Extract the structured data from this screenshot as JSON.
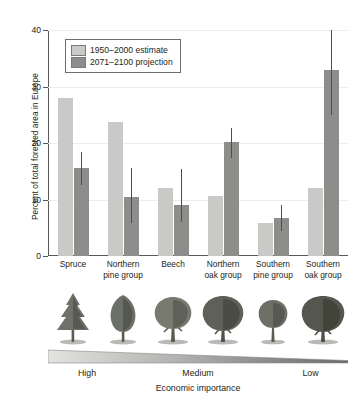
{
  "chart_data": {
    "type": "bar",
    "title": "",
    "xlabel": "Economic importance",
    "ylabel": "Percent of total forested area in Europe",
    "ylim": [
      0,
      40
    ],
    "yticks": [
      0,
      10,
      20,
      30,
      40
    ],
    "ytick_labels": [
      "0",
      "10",
      "20",
      "30",
      "40"
    ],
    "grid": true,
    "legend_position": "upper-left",
    "categories": [
      "Spruce",
      "Northern pine group",
      "Beech",
      "Northern oak group",
      "Southern pine group",
      "Southern oak group"
    ],
    "category_lines": [
      [
        "Spruce"
      ],
      [
        "Northern",
        "pine group"
      ],
      [
        "Beech"
      ],
      [
        "Northern",
        "oak group"
      ],
      [
        "Southern",
        "pine group"
      ],
      [
        "Southern",
        "oak group"
      ]
    ],
    "series": [
      {
        "name": "1950–2000 estimate",
        "color": "#c9c9c7",
        "values": [
          28.0,
          23.8,
          12.1,
          10.6,
          5.8,
          12.0
        ],
        "errors": [
          null,
          null,
          null,
          null,
          null,
          null
        ]
      },
      {
        "name": "2071–2100 projection",
        "color": "#8d8d8b",
        "values": [
          15.5,
          10.4,
          9.0,
          20.1,
          6.7,
          33.0
        ],
        "error_low": [
          12.5,
          5.8,
          6.0,
          17.4,
          4.5,
          25.0
        ],
        "error_high": [
          18.4,
          15.6,
          15.4,
          22.7,
          9.0,
          40.0
        ]
      }
    ],
    "axis_gradient": {
      "labels": [
        "High",
        "Medium",
        "Low"
      ],
      "caption": "Economic importance",
      "direction": "high-to-low"
    },
    "tree_icons": [
      "spruce-conifer-tree",
      "pine-tree",
      "beech-broadleaf-tree",
      "northern-oak-tree",
      "southern-pine-tree",
      "southern-oak-tree"
    ]
  },
  "colors": {
    "estimate_fill": "#c9c9c7",
    "projection_fill": "#8d8d8b",
    "axis": "#58585a",
    "grid": "#ededed",
    "text": "#231f20",
    "error_bar": "#4d4d4d",
    "background": "#ffffff"
  }
}
